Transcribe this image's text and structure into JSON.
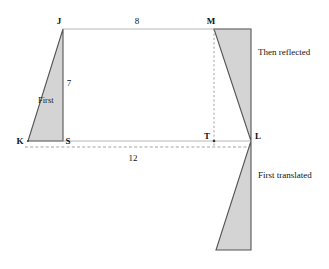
{
  "figure": {
    "colors": {
      "shape_fill": "#d4d4d4",
      "shape_stroke": "#555555",
      "guide_line": "#9a9a9a",
      "dashed_line": "#8c8c8c",
      "text": "#111111",
      "background": "#ffffff"
    },
    "vertices": [
      {
        "name": "J",
        "label": "J",
        "x": 63,
        "y": 29,
        "label_x": 59,
        "label_y": 24
      },
      {
        "name": "M",
        "label": "M",
        "x": 214,
        "y": 29,
        "label_x": 209,
        "label_y": 24
      },
      {
        "name": "K",
        "label": "K",
        "x": 28,
        "y": 141,
        "label_x": 18,
        "label_y": 144
      },
      {
        "name": "S",
        "label": "S",
        "x": 63,
        "y": 141,
        "label_x": 66,
        "label_y": 144
      },
      {
        "name": "T",
        "label": "T",
        "x": 214,
        "y": 141,
        "label_x": 206,
        "label_y": 138
      },
      {
        "name": "L",
        "label": "L",
        "x": 251,
        "y": 141,
        "label_x": 255,
        "label_y": 138
      }
    ],
    "measurements": [
      {
        "name": "top-length",
        "value": "8",
        "x": 137,
        "y": 24
      },
      {
        "name": "vertical-height",
        "value": "7",
        "x": 68,
        "y": 83
      },
      {
        "name": "base-length",
        "value": "12",
        "x": 133,
        "y": 159
      }
    ],
    "region_labels": [
      {
        "name": "first-triangle-label",
        "value": "First",
        "x": 38,
        "y": 103
      }
    ],
    "annotations": [
      {
        "name": "reflected-annotation",
        "value": "Then reflected",
        "x": 258,
        "y": 55
      },
      {
        "name": "translated-annotation",
        "value": "First translated",
        "x": 258,
        "y": 178
      }
    ],
    "shapes": {
      "first_triangle": {
        "name": "first-triangle",
        "points": "63,29 63,141 28,141"
      },
      "reflected_triangle": {
        "name": "reflected-triangle",
        "points": "214,29 251,29 251,141"
      },
      "translated_triangle": {
        "name": "translated-triangle",
        "points": "251,141 251,250 216,250"
      }
    },
    "guides": {
      "top_line": {
        "name": "top-guide-line",
        "x1": 63,
        "y1": 29,
        "x2": 251,
        "y2": 29
      },
      "base_line": {
        "name": "base-guide-line",
        "x1": 28,
        "y1": 141,
        "x2": 251,
        "y2": 141
      },
      "dashed_base": {
        "name": "dashed-base-line",
        "x1": 25,
        "y1": 147,
        "x2": 253,
        "y2": 147
      },
      "dashed_vertical": {
        "name": "dashed-vertical-line",
        "x1": 214,
        "y1": 29,
        "x2": 214,
        "y2": 147
      }
    }
  }
}
